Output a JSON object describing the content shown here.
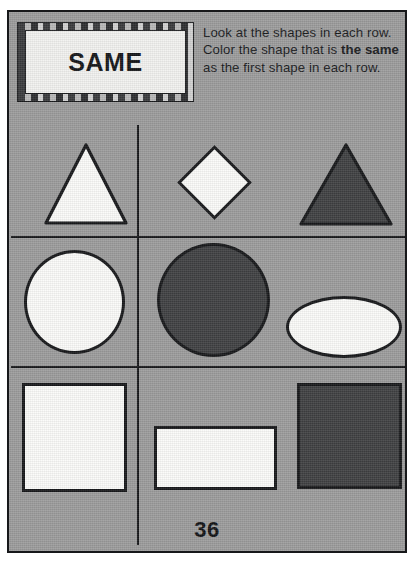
{
  "worksheet": {
    "title": "SAME",
    "page_number": "36",
    "instructions": {
      "part1": "Look at the shapes in each row. Color the shape that is ",
      "emphasis": "the same",
      "part2": " as the first shape in each row."
    }
  },
  "colors": {
    "paper": "#9c9c9c",
    "ink": "#17181a",
    "shape_unfilled": "#fbfbf9",
    "shape_colored": "#3f4042"
  },
  "rows": [
    {
      "row_label": "row-1",
      "cells": [
        {
          "position": "left",
          "shape": "triangle",
          "state": "unfilled",
          "role": "reference"
        },
        {
          "position": "middle",
          "shape": "diamond",
          "state": "unfilled",
          "role": "choice"
        },
        {
          "position": "right",
          "shape": "triangle",
          "state": "colored",
          "role": "answer"
        }
      ]
    },
    {
      "row_label": "row-2",
      "cells": [
        {
          "position": "left",
          "shape": "circle",
          "state": "unfilled",
          "role": "reference"
        },
        {
          "position": "middle",
          "shape": "circle",
          "state": "colored",
          "role": "answer"
        },
        {
          "position": "right",
          "shape": "ellipse",
          "state": "unfilled",
          "role": "choice"
        }
      ]
    },
    {
      "row_label": "row-3",
      "cells": [
        {
          "position": "left",
          "shape": "square",
          "state": "unfilled",
          "role": "reference"
        },
        {
          "position": "middle",
          "shape": "rectangle",
          "state": "unfilled",
          "role": "choice"
        },
        {
          "position": "right",
          "shape": "square",
          "state": "colored",
          "role": "answer"
        }
      ]
    }
  ]
}
